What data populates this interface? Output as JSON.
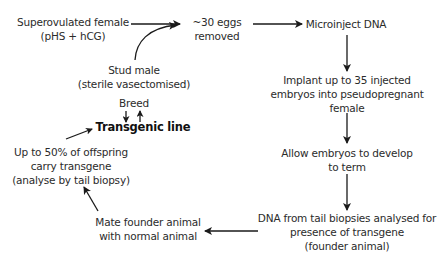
{
  "diagram": {
    "nodes": {
      "superovulated": {
        "lines": [
          "Superovulated female",
          "(pHS + hCG)"
        ]
      },
      "eggs": {
        "lines": [
          "~30 eggs",
          "removed"
        ]
      },
      "stud": {
        "lines": [
          "Stud male",
          "(sterile vasectomised)"
        ]
      },
      "microinject": {
        "lines": [
          "Microinject DNA"
        ]
      },
      "implant": {
        "lines": [
          "Implant up to 35 injected",
          "embryos into pseudopregnant",
          "female"
        ]
      },
      "develop": {
        "lines": [
          "Allow embryos to develop",
          "to term"
        ]
      },
      "analyse": {
        "lines": [
          "DNA from tail biopsies analysed for",
          "presence of transgene",
          "(founder animal)"
        ]
      },
      "mate": {
        "lines": [
          "Mate founder animal",
          "with normal animal"
        ]
      },
      "offspring": {
        "lines": [
          "Up to 50% of offspring",
          "carry transgene",
          "(analyse by tail biopsy)"
        ]
      },
      "breed": {
        "lines": [
          "Breed"
        ]
      },
      "transgenic": {
        "lines": [
          "Transgenic line"
        ]
      }
    },
    "edges": [
      {
        "from": "superovulated",
        "to": "eggs"
      },
      {
        "from": "stud",
        "to": "eggs",
        "style": "curved"
      },
      {
        "from": "eggs",
        "to": "microinject"
      },
      {
        "from": "microinject",
        "to": "implant"
      },
      {
        "from": "implant",
        "to": "develop"
      },
      {
        "from": "develop",
        "to": "analyse"
      },
      {
        "from": "analyse",
        "to": "mate"
      },
      {
        "from": "mate",
        "to": "offspring"
      },
      {
        "from": "offspring",
        "to": "transgenic"
      },
      {
        "from": "breed",
        "to": "transgenic",
        "style": "bidirectional"
      }
    ],
    "colors": {
      "text": "#2b2b2b",
      "arrow": "#1a1a1a",
      "background": "#ffffff"
    }
  }
}
